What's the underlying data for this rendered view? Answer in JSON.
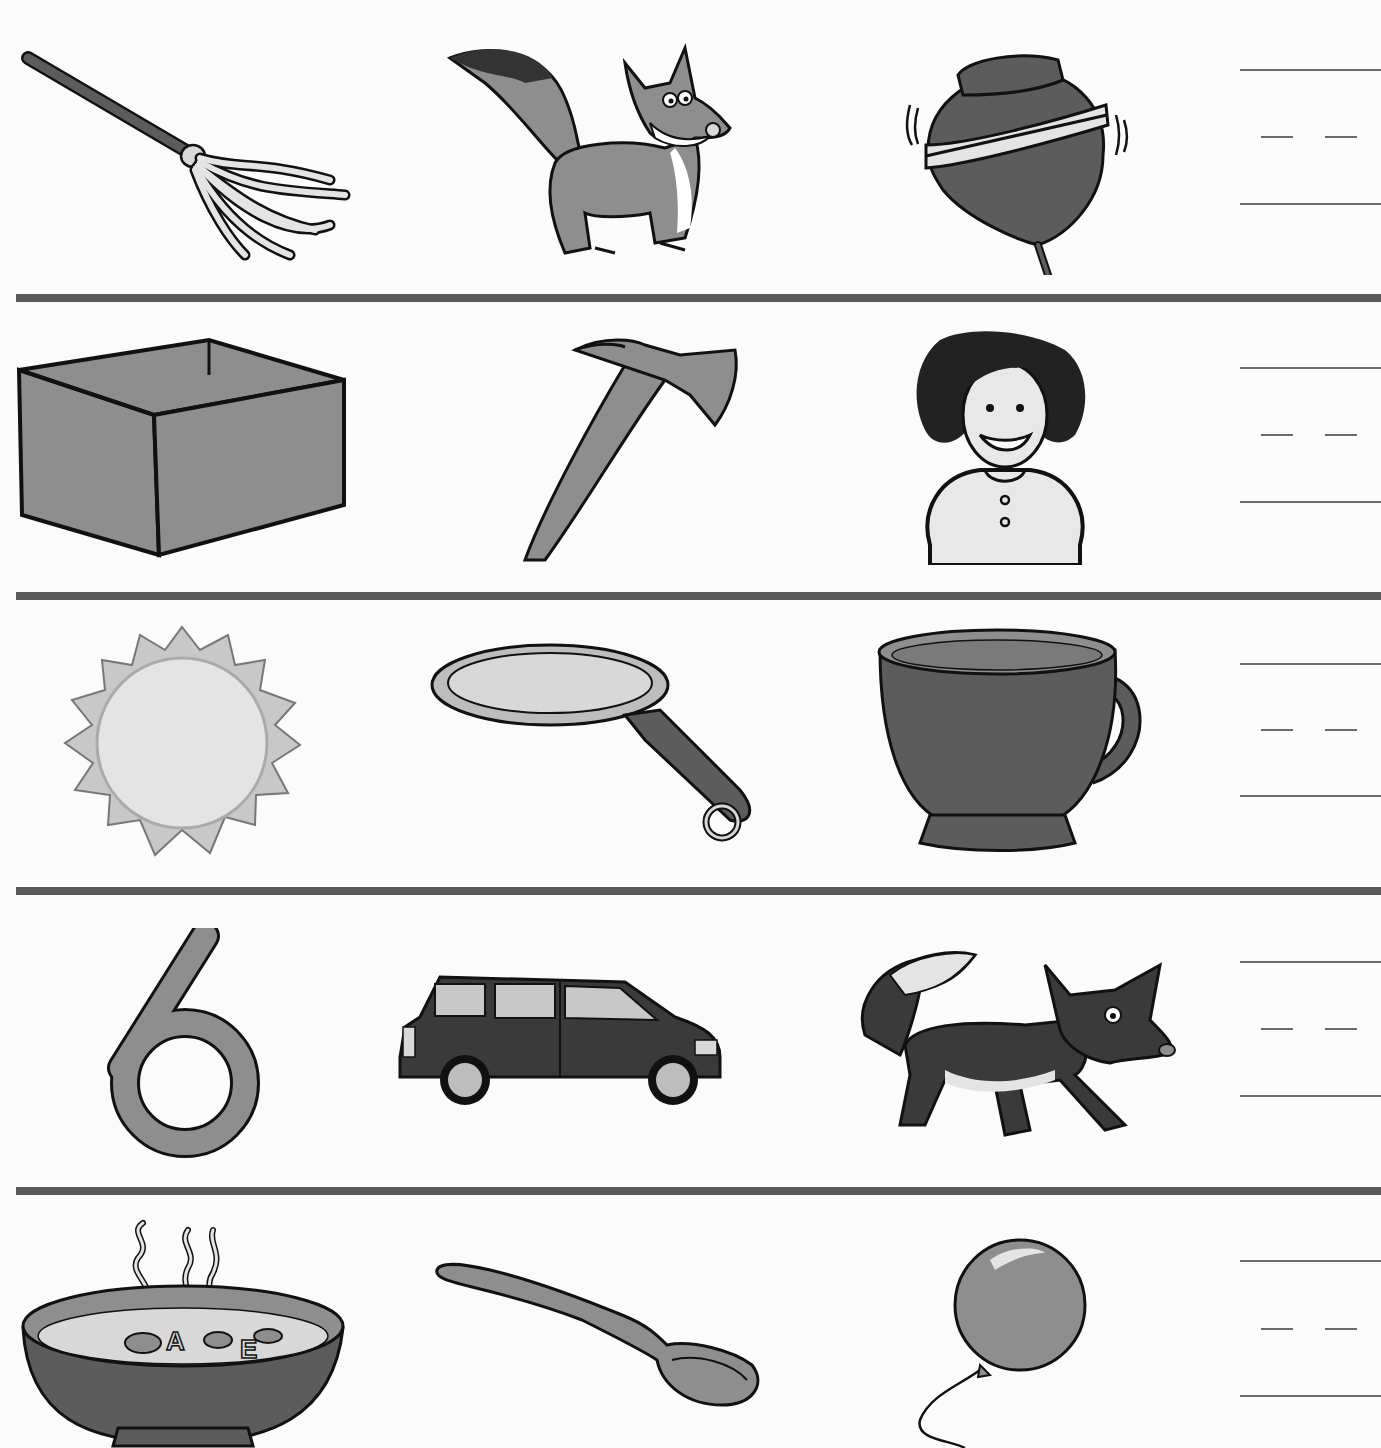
{
  "worksheet": {
    "colors": {
      "ink": "#111111",
      "dark_fill": "#5c5c5c",
      "mid_fill": "#8e8e8e",
      "light_fill": "#d8d8d8",
      "divider": "#5a5a5a",
      "writing_line": "#6b6b6b",
      "paper": "#fbfbfb"
    },
    "rows": [
      {
        "pictures": [
          {
            "name": "mop"
          },
          {
            "name": "fox"
          },
          {
            "name": "top"
          }
        ],
        "answer": ""
      },
      {
        "pictures": [
          {
            "name": "box"
          },
          {
            "name": "ax"
          },
          {
            "name": "girl"
          }
        ],
        "answer": ""
      },
      {
        "pictures": [
          {
            "name": "sun"
          },
          {
            "name": "pan"
          },
          {
            "name": "cup"
          }
        ],
        "answer": ""
      },
      {
        "pictures": [
          {
            "name": "six"
          },
          {
            "name": "van"
          },
          {
            "name": "fox"
          }
        ],
        "answer": ""
      },
      {
        "pictures": [
          {
            "name": "soup"
          },
          {
            "name": "spoon"
          },
          {
            "name": "balloon"
          }
        ],
        "answer": ""
      }
    ]
  }
}
